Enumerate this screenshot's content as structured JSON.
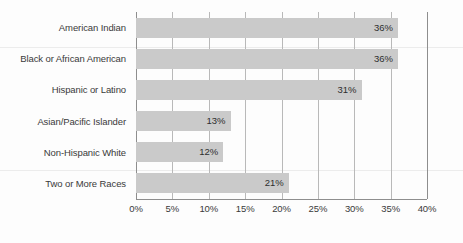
{
  "chart_data": {
    "type": "bar",
    "orientation": "horizontal",
    "title": "",
    "subtitle": "",
    "xlabel": "",
    "ylabel": "",
    "categories": [
      "American Indian",
      "Black or African American",
      "Hispanic or Latino",
      "Asian/Pacific Islander",
      "Non-Hispanic White",
      "Two or More Races"
    ],
    "values": [
      36,
      36,
      31,
      13,
      12,
      21
    ],
    "value_labels": [
      "36%",
      "36%",
      "31%",
      "13%",
      "12%",
      "21%"
    ],
    "xlim": [
      0,
      40
    ],
    "xticks": [
      0,
      5,
      10,
      15,
      20,
      25,
      30,
      35,
      40
    ],
    "xtick_labels": [
      "0%",
      "5%",
      "10%",
      "15%",
      "20%",
      "25%",
      "30%",
      "35%",
      "40%"
    ],
    "grid": "vertical",
    "legend": "none",
    "colors": {
      "bar": "#cacaca",
      "gridline": "#b9b9b9",
      "axis": "#8e8e8e",
      "label_text": "#3a3a3a",
      "value_text": "#2e2e2e",
      "background": "#fdfdfd"
    }
  }
}
